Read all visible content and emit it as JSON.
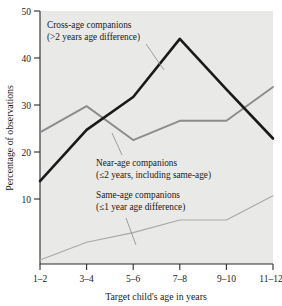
{
  "chart_data": {
    "type": "line",
    "title": "",
    "xlabel": "Target child's age in years",
    "ylabel": "Percentage of observations",
    "categories": [
      "1–2",
      "3–4",
      "5–6",
      "7–8",
      "9–10",
      "11–12"
    ],
    "x_tick_labels": [
      "1–2",
      "3–4",
      "5–6",
      "7–8",
      "9–10",
      "11–12"
    ],
    "y_tick_labels": [
      "10",
      "20",
      "30",
      "40",
      "50"
    ],
    "y_ticks": [
      10,
      20,
      30,
      40,
      50
    ],
    "ylim": [
      0,
      50
    ],
    "grid": false,
    "legend": "none (inline annotations)",
    "series": [
      {
        "name": "Cross-age companions",
        "sublabel": "(>2 years age difference)",
        "color": "#1a1a1a",
        "width": 2.6,
        "values": [
          16.4,
          26.5,
          33.0,
          44.5,
          34.5,
          24.8
        ]
      },
      {
        "name": "Near-age companions",
        "sublabel": "(≤2 years, including same-age)",
        "color": "#8c8c8c",
        "width": 1.9,
        "values": [
          26.0,
          31.2,
          24.5,
          28.3,
          28.3,
          35.0
        ]
      },
      {
        "name": "Same-age companions",
        "sublabel": "(≤1 year age difference)",
        "color": "#a8a8a8",
        "width": 1.1,
        "values": [
          0.8,
          4.3,
          6.2,
          8.7,
          8.7,
          13.5
        ]
      }
    ],
    "annotations": [
      {
        "id": "cross-age",
        "line1": "Cross-age companions",
        "line2": "(>2 years age difference)"
      },
      {
        "id": "near-age",
        "line1": "Near-age companions",
        "line2": "(≤2 years, including same-age)"
      },
      {
        "id": "same-age",
        "line1": "Same-age companions",
        "line2": "(≤1 year age difference)"
      }
    ],
    "colors": {
      "plot_background": "#e9e9e7",
      "page_background": "#ffffff",
      "axis": "#2b2b2b",
      "cross_age": "#1a1a1a",
      "near_age": "#8c8c8c",
      "same_age": "#a8a8a8",
      "leader": "#8a8a8a"
    }
  }
}
